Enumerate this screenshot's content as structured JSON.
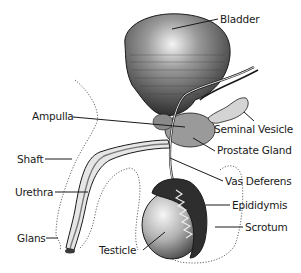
{
  "diagram": {
    "colors": {
      "ink": "#1a1a1a",
      "shade_dark": "#3a3a3a",
      "shade_mid": "#8a8a8a",
      "shade_light": "#c8c8c8",
      "background": "#ffffff"
    },
    "labels": {
      "bladder": "Bladder",
      "seminal_vesicle": "Seminal Vesicle",
      "prostate_gland": "Prostate Gland",
      "vas_deferens": "Vas Deferens",
      "epididymis": "Epididymis",
      "scrotum": "Scrotum",
      "ampulla": "Ampulla",
      "shaft": "Shaft",
      "urethra": "Urethra",
      "glans": "Glans",
      "testicle": "Testicle"
    }
  }
}
